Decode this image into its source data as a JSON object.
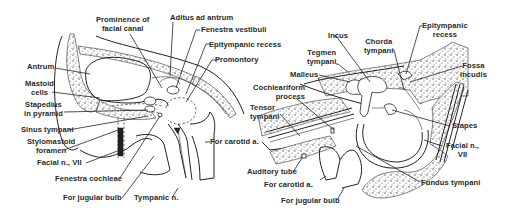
{
  "figure": {
    "left_view": {
      "name": "medial wall of tympanic cavity",
      "labels": {
        "prominence_facial_canal": "Prominence of\nfacial canal",
        "aditus_ad_antrum": "Aditus ad antrum",
        "fenestra_vestibuli": "Fenestra vestibuli",
        "epitympanic_recess": "Epitympanic recess",
        "promontory": "Promontory",
        "antrum": "Antrum",
        "mastoid_cells": "Mastoid\ncells",
        "stapedius_in_pyramid": "Stapedius\nin pyramid",
        "sinus_tympani": "Sinus tympani",
        "stylomastoid_foramen": "Stylomastoid\nforamen",
        "facial_nerve": "Facial n., VII",
        "fenestra_cochleae": "Fenestra cochleae",
        "for_jugular_bulb": "For jugular bulb",
        "tympanic_nerve": "Tympanic n.",
        "for_carotid": "For carotid a."
      }
    },
    "right_view": {
      "name": "lateral wall of tympanic cavity",
      "labels": {
        "incus": "Incus",
        "chorda_tympani": "Chorda\ntympani",
        "epitympanic_recess": "Epitympanic\nrecess",
        "tegmen_tympani": "Tegmen\ntympani",
        "malleus": "Malleus",
        "fossa_incudis": "Fossa\nincudis",
        "cochleariform_process": "Cochleariform\nprocess",
        "tensor_tympani": "Tensor\ntympani",
        "stapes": "Stapes",
        "facial_nerve": "Facial n.,\nVII",
        "auditory_tube": "Auditory tube",
        "for_carotid": "For carotid a.",
        "for_jugular_bulb": "For jugular bulb",
        "fundus_tympani": "Fundus tympani"
      }
    }
  }
}
